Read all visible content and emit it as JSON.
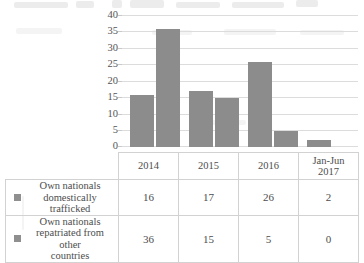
{
  "chart_data": {
    "type": "bar",
    "title": "",
    "xlabel": "",
    "ylabel": "",
    "categories": [
      "2014",
      "2015",
      "2016",
      "Jan-Jun 2017"
    ],
    "series": [
      {
        "name": "Own nationals domestically trafficked",
        "color": "#8c8c8c",
        "values": [
          16,
          17,
          26,
          2
        ]
      },
      {
        "name": "Own nationals repatriated from other countries",
        "color": "#8c8c8c",
        "values": [
          36,
          15,
          5,
          0
        ]
      }
    ],
    "ylim": [
      0,
      40
    ],
    "yticks": [
      0,
      5,
      10,
      15,
      20,
      25,
      30,
      35,
      40
    ],
    "ytick_labels": [
      "0",
      "5",
      "10",
      "15",
      "20",
      "25",
      "30",
      "35",
      "40"
    ],
    "grid": true,
    "legend_position": "table-left"
  },
  "table": {
    "header": [
      "",
      "2014",
      "2015",
      "2016",
      "Jan-Jun 2017"
    ],
    "header_multiline": [
      {
        "line1": "2014",
        "line2": ""
      },
      {
        "line1": "2015",
        "line2": ""
      },
      {
        "line1": "2016",
        "line2": ""
      },
      {
        "line1": "Jan-Jun",
        "line2": "2017"
      }
    ],
    "rows": [
      {
        "label": "Own nationals domestically trafficked",
        "label_lines": [
          "Own nationals",
          "domestically trafficked"
        ],
        "swatch_color": "#8f8f8f",
        "values": [
          "16",
          "17",
          "26",
          "2"
        ]
      },
      {
        "label": "Own nationals repatriated from other countries",
        "label_lines": [
          "Own nationals",
          "repatriated from other",
          "countries"
        ],
        "swatch_color": "#8f8f8f",
        "values": [
          "36",
          "15",
          "5",
          "0"
        ]
      }
    ]
  }
}
